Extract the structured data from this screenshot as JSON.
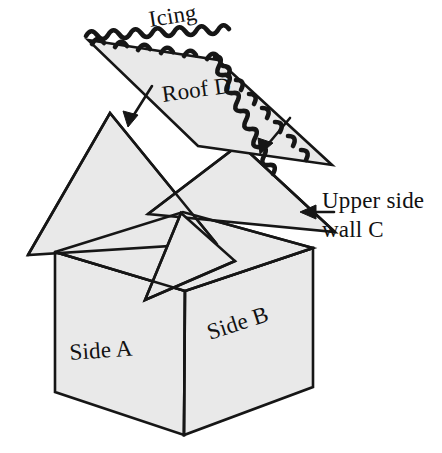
{
  "figure": {
    "background_color": "#ffffff",
    "panel_fill_color": "#e9e9e9",
    "line_color": "#161616"
  },
  "labels": {
    "icing": "Icing",
    "roof_d": "Roof D",
    "upper_side_wall_c_line1": "Upper side",
    "upper_side_wall_c_line2": "wall C",
    "side_a": "Side A",
    "side_b": "Side B"
  },
  "parts": [
    {
      "id": "roof-d",
      "name": "Roof D",
      "shape": "parallelogram",
      "points": "88,40 218,60 332,165 198,146",
      "has_icing_edge": true
    },
    {
      "id": "upper-side-wall-c",
      "name": "Upper side wall C",
      "shape": "triangle",
      "points": "240,144 335,232 148,214"
    },
    {
      "id": "gable-left",
      "name": "Left gable panel",
      "shape": "triangle",
      "points": "110,113 216,243 28,255"
    },
    {
      "id": "box-top-rhombus",
      "name": "Box top opening",
      "shape": "rhombus",
      "points": "55,252 183,212 313,248 185,291"
    },
    {
      "id": "side-a",
      "name": "Side A",
      "shape": "quadrilateral",
      "points": "55,252 185,291 184,435 55,392"
    },
    {
      "id": "side-b",
      "name": "Side B",
      "shape": "quadrilateral",
      "points": "185,291 313,248 313,387 184,435"
    },
    {
      "id": "flap",
      "name": "Folded flap triangle",
      "shape": "triangle",
      "points": "181,213 145,300 235,261"
    }
  ],
  "annotations": [
    {
      "id": "icing-arrow-left",
      "name": "Icing pointer arrow (left)",
      "from": "150,88",
      "to": "128,124"
    },
    {
      "id": "icing-arrow-right",
      "name": "Icing pointer arrow (right)",
      "from": "288,120",
      "to": "261,152"
    },
    {
      "id": "wall-c-pointer",
      "name": "Upper side wall C pointer",
      "from": "334,212",
      "to": "300,212"
    }
  ],
  "icing": {
    "name": "Scalloped icing border",
    "scallop_count_top": 13,
    "scallop_count_right": 10,
    "description": "Wavy scalloped piping along the two upper edges of Roof D"
  },
  "label_positions": {
    "icing": {
      "x": 150,
      "y": 25,
      "rotate": -9
    },
    "roof_d": {
      "x": 165,
      "y": 100,
      "rotate": -8
    },
    "upper_side_wall_c": {
      "x": 322,
      "y": 205,
      "rotate": 0
    },
    "side_a": {
      "x": 70,
      "y": 358,
      "rotate": -4
    },
    "side_b": {
      "x": 212,
      "y": 333,
      "rotate": -18
    }
  }
}
